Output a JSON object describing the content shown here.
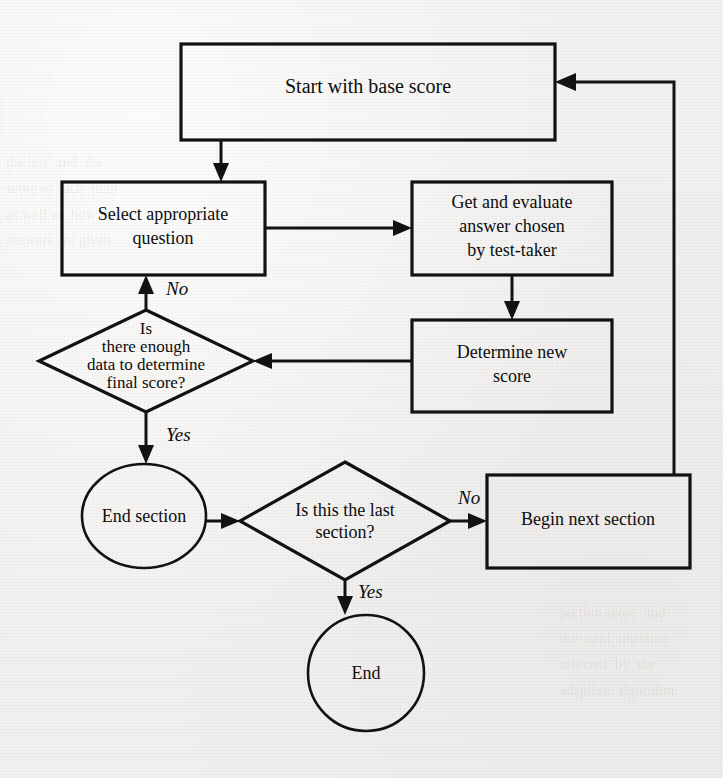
{
  "diagram": {
    "stroke_color": "#121212",
    "paper_color": "#f2f1ef",
    "nodes": {
      "start_score": {
        "shape": "rectangle",
        "label": "Start with base score",
        "x": 181,
        "y": 44,
        "w": 374,
        "h": 96
      },
      "select_question": {
        "shape": "rectangle",
        "line1": "Select appropriate",
        "line2": "question",
        "x": 62,
        "y": 182,
        "w": 203,
        "h": 93
      },
      "get_answer": {
        "shape": "rectangle",
        "line1": "Get and evaluate",
        "line2": "answer chosen",
        "line3": "by test-taker",
        "x": 412,
        "y": 182,
        "w": 200,
        "h": 93
      },
      "determine_score": {
        "shape": "rectangle",
        "line1": "Determine new",
        "line2": "score",
        "x": 412,
        "y": 320,
        "w": 200,
        "h": 92
      },
      "enough_data": {
        "shape": "diamond",
        "line1": "Is",
        "line2": "there enough",
        "line3": "data to determine",
        "line4": "final score?",
        "cx": 146,
        "cy": 361,
        "rx": 107,
        "ry": 51
      },
      "end_section": {
        "shape": "ellipse",
        "label": "End section",
        "cx": 144,
        "cy": 516,
        "rx": 62,
        "ry": 52
      },
      "last_section": {
        "shape": "diamond",
        "line1": "Is this the last",
        "line2": "section?",
        "cx": 345,
        "cy": 521,
        "rx": 105,
        "ry": 59
      },
      "begin_next": {
        "shape": "rectangle",
        "label": "Begin next section",
        "x": 487,
        "y": 475,
        "w": 203,
        "h": 93
      },
      "end": {
        "shape": "circle",
        "label": "End",
        "cx": 366,
        "cy": 673,
        "r": 58
      }
    },
    "edge_labels": {
      "no_retry_question": "No",
      "yes_end_section": "Yes",
      "no_more_sections": "No",
      "yes_finished": "Yes"
    },
    "ghost_text": {
      "left_block": "the test  and  the\nscore of each  item\nas well as  how the\nanswers are given",
      "right_block": "section score  and\nthe  next  question\nselected  by  the\nadaptive  algorithm"
    }
  }
}
